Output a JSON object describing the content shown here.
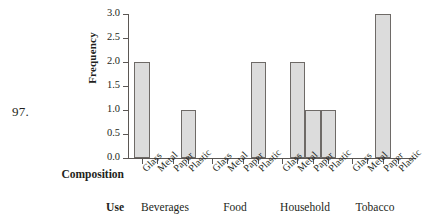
{
  "problem": {
    "number": "97."
  },
  "chart_data": {
    "type": "bar",
    "title": "",
    "xlabel": "Composition",
    "ylabel": "Frequency",
    "grid": false,
    "legend": "none",
    "ylim": [
      0.0,
      3.0
    ],
    "yticks": [
      "0.0",
      "0.5",
      "1.0",
      "1.5",
      "2.0",
      "2.5",
      "3.0"
    ],
    "ytick_values": [
      0.0,
      0.5,
      1.0,
      1.5,
      2.0,
      2.5,
      3.0
    ],
    "group_axis_label": "Use",
    "categories": [
      "Glass",
      "Metal",
      "Paper",
      "Plastic"
    ],
    "groups": [
      {
        "name": "Beverages",
        "values": [
          2.0,
          0.0,
          0.0,
          1.0
        ]
      },
      {
        "name": "Food",
        "values": [
          0.0,
          0.0,
          0.0,
          2.0
        ]
      },
      {
        "name": "Household",
        "values": [
          0.0,
          2.0,
          1.0,
          1.0
        ]
      },
      {
        "name": "Tobacco",
        "values": [
          0.0,
          0.0,
          3.0,
          0.0
        ]
      }
    ],
    "bar_color": "#dcdcdc",
    "bar_edge_color": "#6e6a67",
    "axis_color": "#5b5754",
    "background": "#ffffff"
  }
}
